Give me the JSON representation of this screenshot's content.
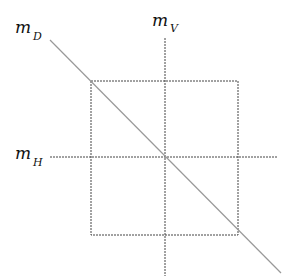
{
  "diagram": {
    "type": "reflection-axes-of-square",
    "labels": {
      "diagonal": {
        "base": "m",
        "sub": "D"
      },
      "vertical": {
        "base": "m",
        "sub": "V"
      },
      "horizontal": {
        "base": "m",
        "sub": "H"
      }
    },
    "colors": {
      "square": "#444444",
      "axes": "#444444",
      "diagonal": "#999999",
      "text": "#111111"
    },
    "geometry": {
      "square": {
        "x": 91,
        "y": 81,
        "w": 147,
        "h": 154
      },
      "vertical_axis": {
        "x": 165,
        "y1": 38,
        "y2": 276
      },
      "horizontal_axis": {
        "y": 157,
        "x1": 50,
        "x2": 278
      },
      "diagonal": {
        "x1": 50,
        "y1": 40,
        "x2": 281,
        "y2": 273
      }
    }
  }
}
